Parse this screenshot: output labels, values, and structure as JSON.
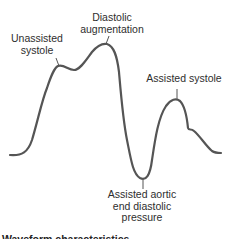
{
  "figure": {
    "type": "intra-aortic balloon pump arterial pressure waveform",
    "stroke_color": "#555555",
    "labels": {
      "unassisted_systole": [
        "Unassisted",
        "systole"
      ],
      "diastolic_augmentation": [
        "Diastolic",
        "augmentation"
      ],
      "assisted_systole": [
        "Assisted systole"
      ],
      "assisted_aortic_end_diastolic_pressure": [
        "Assisted aortic",
        "end diastolic",
        "pressure"
      ]
    },
    "caption_partial": "Waveform characteristics"
  }
}
